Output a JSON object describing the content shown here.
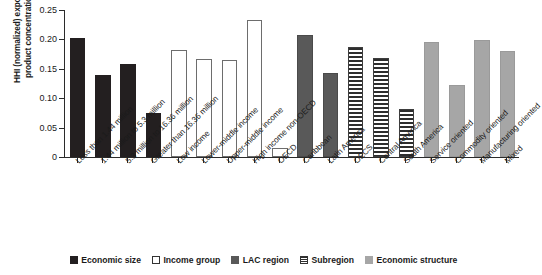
{
  "chart_data": {
    "type": "bar",
    "title": "",
    "xlabel": "",
    "ylabel": "HHI (normalized) exports product concentration",
    "ylabel_lines": [
      "HHI (normalized) exports",
      "product concentration"
    ],
    "ylim": [
      0,
      0.25
    ],
    "yticks": [
      "0",
      "0.05",
      "0.10",
      "0.15",
      "0.20",
      "0.25"
    ],
    "ytick_values": [
      0,
      0.05,
      0.1,
      0.15,
      0.2,
      0.25
    ],
    "grid": false,
    "legend_position": "bottom",
    "categories": [
      "Less than 1.44 million",
      "1.44 million to 5.3 million",
      "5.3 million to 16.36 million",
      "Greater than 16.36 million",
      "Low income",
      "Lower-middle income",
      "Upper-middle income",
      "High income non-OECD",
      "OECD",
      "Caribbean",
      "Latin America",
      "OECS",
      "Central America",
      "South America",
      "Service oriented",
      "Commodity oriented",
      "Manufacturing oriented",
      "Mixed"
    ],
    "values": [
      0.202,
      0.139,
      0.159,
      0.075,
      0.182,
      0.166,
      0.165,
      0.233,
      0.016,
      0.208,
      0.143,
      0.187,
      0.169,
      0.082,
      0.196,
      0.122,
      0.199,
      0.181
    ],
    "groups": [
      "size",
      "size",
      "size",
      "size",
      "income",
      "income",
      "income",
      "income",
      "income",
      "lac",
      "lac",
      "sub",
      "sub",
      "sub",
      "struct",
      "struct",
      "struct",
      "struct"
    ],
    "legend": [
      {
        "label": "Economic size",
        "key": "size",
        "color": "#231f20"
      },
      {
        "label": "Income group",
        "key": "income",
        "color": "#ffffff"
      },
      {
        "label": "LAC region",
        "key": "lac",
        "color": "#595959"
      },
      {
        "label": "Subregion",
        "key": "sub",
        "color": "#2e2e2e"
      },
      {
        "label": "Economic structure",
        "key": "struct",
        "color": "#a6a6a6"
      }
    ]
  }
}
